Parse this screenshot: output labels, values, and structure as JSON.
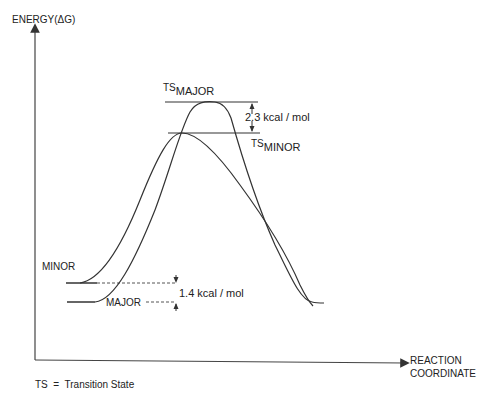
{
  "axes": {
    "y_label": "ENERGY(ΔG)",
    "x_label_line1": "REACTION",
    "x_label_line2": "COORDINATE"
  },
  "states": {
    "ts_major": {
      "prefix": "TS",
      "sub": "MAJOR"
    },
    "ts_minor": {
      "prefix": "TS",
      "sub": "MINOR"
    },
    "minor": "MINOR",
    "major": "MAJOR"
  },
  "annotations": {
    "ts_gap": "2.3 kcal / mol",
    "ground_gap": "1.4 kcal / mol"
  },
  "footnote": "TS  =  Transition State",
  "colors": {
    "line": "#333333",
    "background": "#ffffff"
  }
}
